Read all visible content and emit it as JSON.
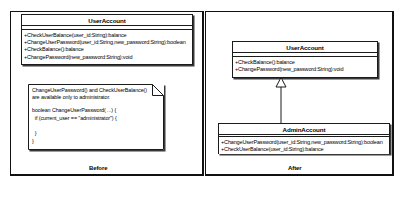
{
  "diagram": {
    "type": "uml-class-diagram",
    "panels": [
      {
        "id": "before",
        "caption": "Before"
      },
      {
        "id": "after",
        "caption": "After"
      }
    ]
  },
  "before": {
    "class_useraccount": {
      "name": "UserAccount",
      "attributes": [],
      "operations": [
        "+CheckUserBalance(user_id:String):balance",
        "+ChangeUserPassword(user_id:String,new_password:String):boolean",
        "+CheckBalance():balance",
        "+ChangePassword(new_password:String):void"
      ]
    },
    "note": {
      "text_lines": [
        "ChangeUserPassword() and CheckUserBalance()",
        "are available only to administrator."
      ],
      "code_lines": [
        "boolean ChangeUserPassword( ...) {",
        "  if (current_user == \"administrator\") {",
        "",
        "  }",
        "}"
      ]
    }
  },
  "after": {
    "class_useraccount": {
      "name": "UserAccount",
      "attributes": [],
      "operations": [
        "+CheckBalance():balance",
        "+ChangePassword(new_password:String):void"
      ]
    },
    "class_adminaccount": {
      "name": "AdminAccount",
      "attributes": [],
      "operations": [
        "+ChangeUserPassword(user_id:String,new_password:String):boolean",
        "+CheckUserBalance(user_id:String):balance"
      ]
    },
    "relationship": {
      "kind": "generalization",
      "from": "AdminAccount",
      "to": "UserAccount"
    }
  },
  "colors": {
    "background": "#ffffff",
    "stroke": "#1b1b1b",
    "frame": "#111111",
    "shadow": "#3a3a3a",
    "text": "#000000"
  }
}
